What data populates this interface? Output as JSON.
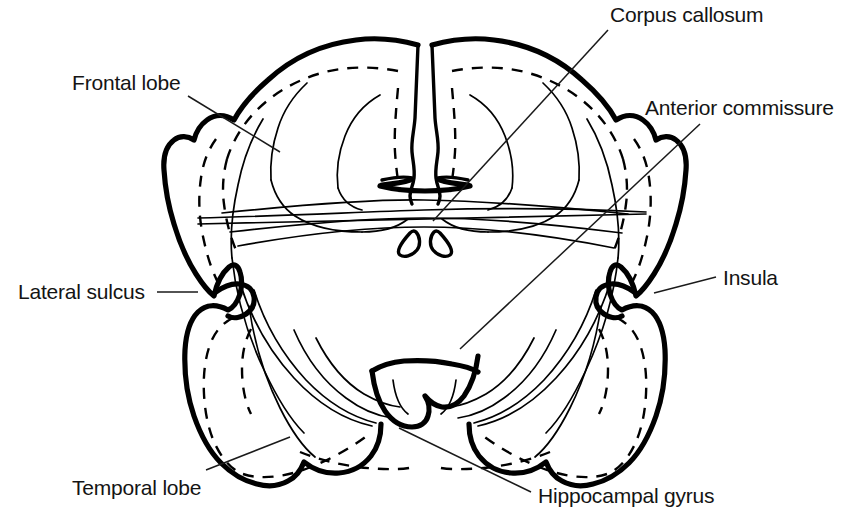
{
  "figure": {
    "view": "coronal-section",
    "background_color": "#ffffff",
    "ink_color": "#000000",
    "width": 853,
    "height": 511
  },
  "labels": [
    {
      "id": "corpus-callosum",
      "text": "Corpus callosum",
      "text_x": 610,
      "text_y": 22,
      "anchor": "start",
      "leader": "M 608 30 L 433 221"
    },
    {
      "id": "anterior-commissure",
      "text": "Anterior commissure",
      "text_x": 645,
      "text_y": 115,
      "anchor": "start",
      "leader": "M 700 124 L 460 349"
    },
    {
      "id": "frontal-lobe",
      "text": "Frontal lobe",
      "text_x": 72,
      "text_y": 90,
      "anchor": "start",
      "leader": "M 188 96 L 280 152"
    },
    {
      "id": "lateral-sulcus",
      "text": "Lateral sulcus",
      "text_x": 18,
      "text_y": 299,
      "anchor": "start",
      "leader": "M 157 292 L 198 292"
    },
    {
      "id": "insula",
      "text": "Insula",
      "text_x": 723,
      "text_y": 285,
      "anchor": "start",
      "leader": "M 716 277 L 654 293"
    },
    {
      "id": "temporal-lobe",
      "text": "Temporal lobe",
      "text_x": 72,
      "text_y": 495,
      "anchor": "start",
      "leader": "M 206 470 L 290 437"
    },
    {
      "id": "hippocampal-gyrus",
      "text": "Hippocampal gyrus",
      "text_x": 538,
      "text_y": 503,
      "anchor": "start",
      "leader": "M 531 492 L 399 428"
    }
  ],
  "structures": {
    "outer_cortex_label": "cerebral hemispheres outer contour",
    "midline_label": "interhemispheric fissure",
    "corpus_callosum_label": "corpus callosum body",
    "anterior_commissure_label": "anterior commissure paired nuclei",
    "lateral_sulcus_left_label": "left lateral sulcus notch",
    "lateral_sulcus_right_label": "right lateral sulcus notch",
    "hippocampal_gyrus_label": "hippocampal gyrus",
    "temporal_lobe_left_label": "left temporal lobe",
    "temporal_lobe_right_label": "right temporal lobe"
  }
}
